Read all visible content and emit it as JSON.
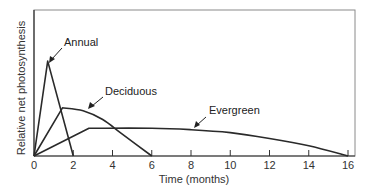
{
  "chart_data": {
    "type": "line",
    "title": "",
    "xlabel": "Time (months)",
    "ylabel": "Relative net photosynthesis",
    "xlim": [
      0,
      16
    ],
    "ylim": [
      0,
      1
    ],
    "xticks": [
      0,
      2,
      4,
      6,
      8,
      10,
      12,
      14,
      16
    ],
    "xtick_labels": [
      "0",
      "2",
      "4",
      "6",
      "8",
      "10",
      "12",
      "14",
      "16"
    ],
    "yticks": [],
    "grid": false,
    "legend": "none (direct annotations with arrows)",
    "series": [
      {
        "name": "Annual",
        "x": [
          0,
          0.7,
          2
        ],
        "y": [
          0,
          0.65,
          0
        ]
      },
      {
        "name": "Deciduous",
        "x": [
          0,
          1.45,
          2.5,
          3.5,
          4.5,
          6
        ],
        "y": [
          0,
          0.33,
          0.31,
          0.25,
          0.15,
          0
        ]
      },
      {
        "name": "Evergreen",
        "x": [
          0,
          2.8,
          6,
          8,
          10,
          12,
          14,
          16
        ],
        "y": [
          0,
          0.19,
          0.19,
          0.18,
          0.16,
          0.12,
          0.07,
          0
        ]
      }
    ],
    "annotations": [
      {
        "text": "Annual",
        "points_to": "Annual peak"
      },
      {
        "text": "Deciduous",
        "points_to": "Deciduous curve near peak"
      },
      {
        "text": "Evergreen",
        "points_to": "Evergreen curve near 8 months"
      }
    ]
  },
  "labels": {
    "xlabel": "Time (months)",
    "ylabel": "Relative net photosynthesis",
    "annual": "Annual",
    "deciduous": "Deciduous",
    "evergreen": "Evergreen",
    "ticks": [
      "0",
      "2",
      "4",
      "6",
      "8",
      "10",
      "12",
      "14",
      "16"
    ]
  }
}
